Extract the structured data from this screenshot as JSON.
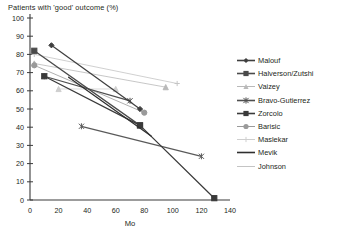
{
  "chart_data": {
    "type": "line",
    "title": "Patients with 'good' outcome (%)",
    "xlabel": "Mo",
    "ylabel": "Patients with 'good' outcome (%)",
    "xlim": [
      0,
      140
    ],
    "ylim": [
      0,
      100
    ],
    "xticks": [
      0,
      20,
      40,
      60,
      80,
      100,
      120,
      140
    ],
    "yticks": [
      0,
      10,
      20,
      30,
      40,
      50,
      60,
      70,
      80,
      90,
      100
    ],
    "grid": false,
    "legend_position": "right",
    "series": [
      {
        "name": "Malouf",
        "marker": "diamond",
        "color": "#3f3f3f",
        "points": [
          [
            15,
            85
          ],
          [
            77,
            50
          ]
        ]
      },
      {
        "name": "Halverson/Zutshi",
        "marker": "square",
        "color": "#4a4a4a",
        "points": [
          [
            3,
            82
          ],
          [
            77,
            41
          ]
        ]
      },
      {
        "name": "Vaizey",
        "marker": "triangle",
        "color": "#b9b9b9",
        "points": [
          [
            3,
            75
          ],
          [
            95,
            62
          ]
        ]
      },
      {
        "name": "Bravo-Gutierrez",
        "marker": "asterisk",
        "color": "#4f4f4f",
        "points": [
          [
            10,
            68
          ],
          [
            70,
            54.5
          ]
        ]
      },
      {
        "name": "Zorcolo",
        "marker": "square",
        "color": "#3a3a3a",
        "points": [
          [
            10,
            68
          ],
          [
            77,
            41
          ],
          [
            129,
            1
          ]
        ]
      },
      {
        "name": "Barisic",
        "marker": "circle",
        "color": "#9a9a9a",
        "points": [
          [
            3,
            74
          ],
          [
            80,
            48
          ]
        ]
      },
      {
        "name": "Maslekar",
        "marker": "triangle",
        "color": "#cfcfcf",
        "points": [
          [
            20,
            61
          ],
          [
            60,
            61
          ]
        ]
      },
      {
        "name": "Mevik",
        "marker": "none",
        "color": "#2f2f2f",
        "points": [
          [
            27,
            67.5
          ],
          [
            85,
            35
          ]
        ]
      },
      {
        "name": "Johnson",
        "marker": "plus",
        "color": "#c4c4c4",
        "points": [
          [
            3,
            80
          ],
          [
            103,
            64
          ]
        ]
      },
      {
        "name": "Maslekar-long",
        "marker": "asterisk",
        "color": "#5a5a5a",
        "points": [
          [
            36,
            40.5
          ],
          [
            120,
            24
          ]
        ]
      }
    ]
  },
  "legend": {
    "items": [
      {
        "label": "Malouf",
        "marker": "diamond",
        "color": "#3f3f3f"
      },
      {
        "label": "Halverson/Zutshi",
        "marker": "square",
        "color": "#4a4a4a"
      },
      {
        "label": "Vaizey",
        "marker": "triangle",
        "color": "#b9b9b9"
      },
      {
        "label": "Bravo-Gutierrez",
        "marker": "asterisk",
        "color": "#4f4f4f"
      },
      {
        "label": "Zorcolo",
        "marker": "square",
        "color": "#3a3a3a"
      },
      {
        "label": "Barisic",
        "marker": "circle",
        "color": "#9a9a9a"
      },
      {
        "label": "Maslekar",
        "marker": "plus",
        "color": "#cfcfcf"
      },
      {
        "label": "Mevik",
        "marker": "none",
        "color": "#2f2f2f"
      },
      {
        "label": "Johnson",
        "marker": "none",
        "color": "#c4c4c4"
      }
    ]
  }
}
